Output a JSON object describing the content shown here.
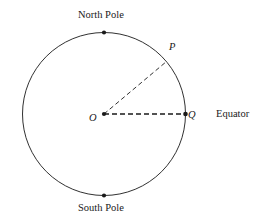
{
  "figure": {
    "type": "geometry-diagram",
    "background_color": "#ffffff",
    "stroke_color": "#1a1a1a"
  },
  "labels": {
    "north_pole": "North Pole",
    "south_pole": "South Pole",
    "equator": "Equator",
    "center_point": "O",
    "surface_point": "P",
    "equator_point": "Q"
  },
  "geometry": {
    "circle": {
      "center_x": 104,
      "center_y": 114,
      "radius": 81.5,
      "stroke_width": 0.9
    },
    "points": [
      {
        "name": "north-pole-point",
        "x": 104,
        "y": 32.5,
        "radius": 2.1
      },
      {
        "name": "south-pole-point",
        "x": 104,
        "y": 195.5,
        "radius": 2.1
      },
      {
        "name": "center-point-o",
        "x": 104,
        "y": 114,
        "radius": 2.1
      },
      {
        "name": "equator-point-q",
        "x": 185.5,
        "y": 114,
        "radius": 2.3
      }
    ],
    "radii": [
      {
        "name": "radius-op",
        "x1": 104,
        "y1": 114,
        "x2": 166.5,
        "y2": 61.5,
        "dash": "4.5 3",
        "stroke_width": 0.9
      },
      {
        "name": "radius-oq",
        "x1": 104,
        "y1": 114,
        "x2": 185.5,
        "y2": 114,
        "dash": "5 3",
        "stroke_width": 1.3
      }
    ]
  }
}
